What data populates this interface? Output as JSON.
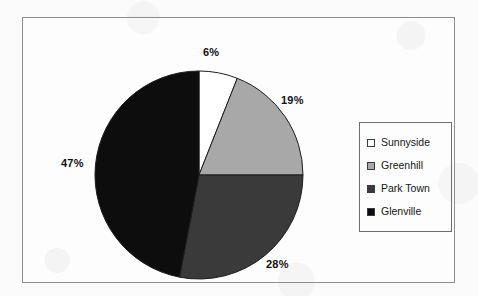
{
  "chart_data": {
    "type": "pie",
    "title": "",
    "categories": [
      "Sunnyside",
      "Greenhill",
      "Park Town",
      "Glenville"
    ],
    "values": [
      6,
      19,
      28,
      47
    ],
    "value_labels": [
      "6%",
      "19%",
      "28%",
      "47%"
    ],
    "unit": "%",
    "start_angle_deg": 0,
    "direction": "clockwise",
    "legend_position": "right",
    "grid": false,
    "colors": [
      "#ffffff",
      "#a8a8a8",
      "#3a3a3a",
      "#0d0d0d"
    ],
    "slices": [
      {
        "label": "Sunnyside",
        "value": 6,
        "value_label": "6%",
        "color": "#ffffff"
      },
      {
        "label": "Greenhill",
        "value": 19,
        "value_label": "19%",
        "color": "#a8a8a8"
      },
      {
        "label": "Park Town",
        "value": 28,
        "value_label": "28%",
        "color": "#3a3a3a"
      },
      {
        "label": "Glenville",
        "value": 47,
        "value_label": "47%",
        "color": "#0d0d0d"
      }
    ]
  },
  "legend": {
    "items": [
      {
        "label": "Sunnyside",
        "color": "#ffffff"
      },
      {
        "label": "Greenhill",
        "color": "#a8a8a8"
      },
      {
        "label": "Park Town",
        "color": "#3a3a3a"
      },
      {
        "label": "Glenville",
        "color": "#0d0d0d"
      }
    ]
  },
  "style": {
    "background": "#fbfbfb",
    "frame_border": "#8d8d91",
    "legend_border": "#6e6e72",
    "label_color": "#111111"
  }
}
